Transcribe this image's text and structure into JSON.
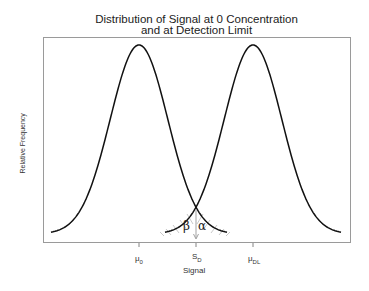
{
  "chart_data": {
    "type": "line",
    "title_lines": [
      "Distribution of Signal at 0 Concentration",
      "and at Detection Limit"
    ],
    "xlabel": "Signal",
    "ylabel": "Relative Frequency",
    "grid": false,
    "legend": null,
    "x_ticks": [
      {
        "label": "μ",
        "sub": "0",
        "pos": 0
      },
      {
        "label": "S",
        "sub": "D",
        "pos": 0.5
      },
      {
        "label": "μ",
        "sub": "DL",
        "pos": 1
      }
    ],
    "series": [
      {
        "name": "Signal distribution at 0 concentration",
        "distribution": "normal",
        "mean": "μ0",
        "mean_pos": 0,
        "sd_relative": 0.253
      },
      {
        "name": "Signal distribution at detection limit",
        "distribution": "normal",
        "mean": "μDL",
        "mean_pos": 1,
        "sd_relative": 0.253
      }
    ],
    "annotations": [
      {
        "text": "β",
        "meaning": "false negative area (tail of μDL curve left of SD)"
      },
      {
        "text": "α",
        "meaning": "false positive area (tail of μ0 curve right of SD)"
      },
      {
        "type": "arrow",
        "at": "SD",
        "from": "curve intersection",
        "to": "baseline"
      }
    ],
    "shaded_region": "overlap tails around SD"
  },
  "labels": {
    "title_line1": "Distribution of Signal at 0 Concentration",
    "title_line2": "and at Detection Limit",
    "ylabel": "Relative Frequency",
    "xlabel": "Signal",
    "tick_mu0_main": "μ",
    "tick_mu0_sub": "0",
    "tick_sd_main": "S",
    "tick_sd_sub": "D",
    "tick_mudl_main": "μ",
    "tick_mudl_sub": "DL",
    "beta": "β",
    "alpha": "α"
  }
}
